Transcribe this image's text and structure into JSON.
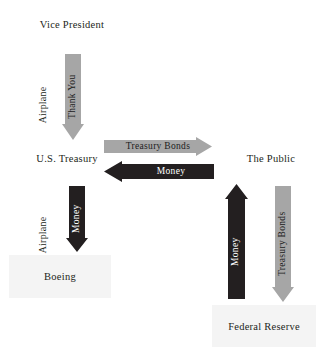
{
  "diagram": {
    "colors": {
      "light_arrow": "#a6a6a6",
      "dark_arrow": "#231f20",
      "node_text": "#231f20",
      "node_box": "#f4f4f4",
      "background": "#ffffff"
    },
    "nodes": [
      {
        "id": "vice-president",
        "label": "Vice President"
      },
      {
        "id": "us-treasury",
        "label": "U.S. Treasury"
      },
      {
        "id": "boeing",
        "label": "Boeing"
      },
      {
        "id": "the-public",
        "label": "The Public"
      },
      {
        "id": "federal-reserve",
        "label": "Federal Reserve"
      }
    ],
    "labels": [
      {
        "id": "airplane-top",
        "label": "Airplane"
      },
      {
        "id": "airplane-bottom",
        "label": "Airplane"
      }
    ],
    "arrows": [
      {
        "id": "thank-you",
        "label": "Thank You",
        "style": "light",
        "direction": "down",
        "from": "Vice President",
        "to": "U.S. Treasury"
      },
      {
        "id": "treasury-bonds-right",
        "label": "Treasury Bonds",
        "style": "light",
        "direction": "right",
        "from": "U.S. Treasury",
        "to": "The Public"
      },
      {
        "id": "money-left",
        "label": "Money",
        "style": "dark",
        "direction": "left",
        "from": "The Public",
        "to": "U.S. Treasury"
      },
      {
        "id": "money-down-boeing",
        "label": "Money",
        "style": "dark",
        "direction": "down",
        "from": "U.S. Treasury",
        "to": "Boeing"
      },
      {
        "id": "money-up-public",
        "label": "Money",
        "style": "dark",
        "direction": "up",
        "from": "Federal Reserve",
        "to": "The Public"
      },
      {
        "id": "treasury-bonds-down",
        "label": "Treasury Bonds",
        "style": "light",
        "direction": "down",
        "from": "The Public",
        "to": "Federal Reserve"
      }
    ]
  }
}
